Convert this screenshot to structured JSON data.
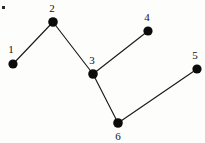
{
  "figure": {
    "kind": "node-link-graph",
    "background_color": "#fdfdfc",
    "node_color": "#0b0b0b",
    "edge_color": "#1a1a1a",
    "label_color": "#121212",
    "width": 205,
    "height": 143
  },
  "chart_data": {
    "type": "scatter",
    "title": "",
    "xlabel": "",
    "ylabel": "",
    "grid": false,
    "legend": null,
    "xlim": [
      0,
      205
    ],
    "ylim": [
      0,
      143
    ],
    "nodes": [
      {
        "id": "1",
        "label": "1",
        "x": 13,
        "y": 64,
        "r": 4.6,
        "label_x": 11,
        "label_y": 53,
        "label_position": "above-left"
      },
      {
        "id": "2",
        "label": "2",
        "x": 53,
        "y": 22,
        "r": 4.8,
        "label_x": 52,
        "label_y": 12,
        "label_position": "above"
      },
      {
        "id": "3",
        "label": "3",
        "x": 93,
        "y": 74,
        "r": 4.8,
        "label_x": 92,
        "label_y": 64,
        "label_position": "above"
      },
      {
        "id": "4",
        "label": "4",
        "x": 148,
        "y": 31,
        "r": 4.6,
        "label_x": 147,
        "label_y": 21,
        "label_position": "above"
      },
      {
        "id": "5",
        "label": "5",
        "x": 197,
        "y": 69,
        "r": 4.6,
        "label_x": 195,
        "label_y": 59,
        "label_position": "above"
      },
      {
        "id": "6",
        "label": "6",
        "x": 118,
        "y": 123,
        "r": 4.8,
        "label_x": 118,
        "label_y": 140,
        "label_position": "below"
      }
    ],
    "edges": [
      {
        "from": "1",
        "to": "2",
        "x1": 13,
        "y1": 64,
        "x2": 53,
        "y2": 22
      },
      {
        "from": "2",
        "to": "3",
        "x1": 53,
        "y1": 22,
        "x2": 93,
        "y2": 74
      },
      {
        "from": "3",
        "to": "4",
        "x1": 93,
        "y1": 74,
        "x2": 148,
        "y2": 31
      },
      {
        "from": "3",
        "to": "6",
        "x1": 93,
        "y1": 74,
        "x2": 118,
        "y2": 123
      },
      {
        "from": "6",
        "to": "5",
        "x1": 118,
        "y1": 123,
        "x2": 197,
        "y2": 69
      }
    ],
    "marks": [
      {
        "id": "speck",
        "x": 2,
        "y": 6,
        "w": 3,
        "h": 3
      }
    ]
  }
}
